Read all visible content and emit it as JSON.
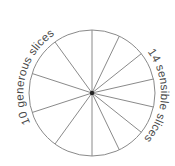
{
  "diagram": {
    "type": "sliced-circle-comparison",
    "left_half": {
      "label": "10 generous slices",
      "total_slices": 10,
      "slices_shown": 5
    },
    "right_half": {
      "label": "14 sensible slices",
      "total_slices": 14,
      "slices_shown": 7
    },
    "colors": {
      "stroke": "#8a8a8a",
      "center_dot": "#222222",
      "text": "#4a4a4a",
      "background": "#ffffff"
    }
  }
}
